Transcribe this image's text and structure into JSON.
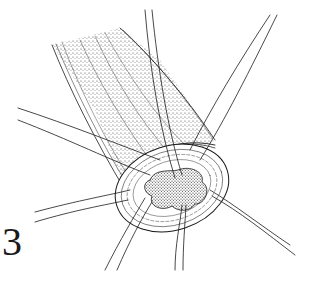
{
  "figure": {
    "label": "3",
    "colors": {
      "ink": "#1a1a1a",
      "paper": "#ffffff"
    }
  }
}
